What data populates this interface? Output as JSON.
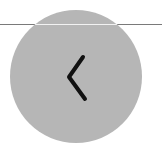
{
  "back_button": {
    "icon": "chevron-left-icon",
    "label": "Back",
    "background_color": "#b6b6b6",
    "icon_color": "#111111"
  },
  "divider": {
    "color": "#7a7a7a"
  }
}
